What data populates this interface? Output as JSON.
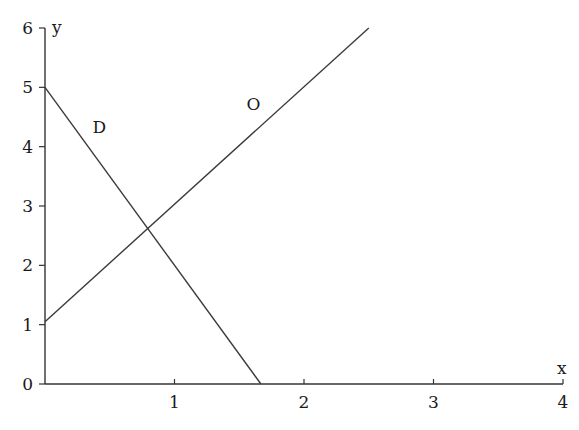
{
  "chart_data": {
    "type": "line",
    "title": "",
    "xlabel": "x",
    "ylabel": "y",
    "xlim": [
      0,
      4
    ],
    "ylim": [
      0,
      6
    ],
    "x_ticks": [
      1,
      2,
      3,
      4
    ],
    "y_ticks": [
      0,
      1,
      2,
      3,
      4,
      5,
      6
    ],
    "x_tick_labels": [
      "1",
      "2",
      "3",
      "4"
    ],
    "y_tick_labels": [
      "0",
      "1",
      "2",
      "3",
      "4",
      "5",
      "6"
    ],
    "grid": false,
    "legend": "none",
    "series": [
      {
        "name": "D",
        "label": "D",
        "points": [
          [
            0,
            5
          ],
          [
            1.667,
            0
          ]
        ],
        "label_at": [
          0.42,
          4.33
        ]
      },
      {
        "name": "O",
        "label": "O",
        "points": [
          [
            0,
            1.05
          ],
          [
            2.5,
            6
          ]
        ],
        "label_at": [
          1.61,
          4.72
        ]
      }
    ],
    "intersection": [
      0.78,
      2.6
    ]
  }
}
